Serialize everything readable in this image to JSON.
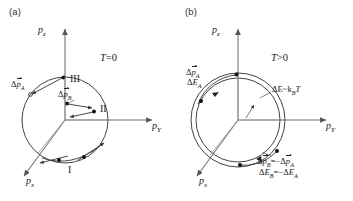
{
  "figure": {
    "panels": [
      {
        "tag": "(a)",
        "condition": "T=0",
        "condition_symbol": "T",
        "condition_op": "=",
        "condition_value": "0",
        "axes": {
          "z": "p",
          "z_sub": "z",
          "y": "p",
          "y_sub": "Y",
          "x": "p",
          "x_sub": "x"
        },
        "regions": [
          "I",
          "II",
          "III"
        ],
        "annotations": [
          {
            "delta": "Δ",
            "symbol": "p",
            "sub": "A",
            "vector": true
          },
          {
            "delta": "Δ",
            "symbol": "p",
            "sub": "B",
            "vector": true
          }
        ],
        "shell": "single"
      },
      {
        "tag": "(b)",
        "condition": "T>0",
        "condition_symbol": "T",
        "condition_op": ">",
        "condition_value": "0",
        "axes": {
          "z": "p",
          "z_sub": "z",
          "y": "p",
          "y_sub": "Y",
          "x": "p",
          "x_sub": "x"
        },
        "annotations": [
          {
            "line1_momentum": "Δp⃗",
            "line1_sub": "A"
          },
          {
            "line2_energy": "ΔE",
            "line2_sub": "A"
          }
        ],
        "thermal_width": "ΔE~k",
        "thermal_width_sub": "B",
        "thermal_width_tail": "T",
        "relation_momentum_lhs": "Δp",
        "relation_momentum_lhs_sub": "B",
        "relation_momentum_rhs": "Δp",
        "relation_momentum_rhs_sub": "A",
        "relation_energy_lhs": "ΔE",
        "relation_energy_lhs_sub": "B",
        "relation_energy_rhs": "ΔE",
        "relation_energy_rhs_sub": "A",
        "shell": "double"
      }
    ],
    "colors": {
      "ink": "#222222",
      "axis": "#555555",
      "circle": "#444444",
      "background": "#ffffff"
    }
  },
  "labels": {
    "panel_a_tag": "(a)",
    "panel_b_tag": "(b)",
    "T_zero_sym": "T",
    "T_zero_op": "=",
    "T_zero_val": "0",
    "T_pos_sym": "T",
    "T_pos_op": ">",
    "T_pos_val": "0",
    "pz": "p",
    "pz_sub": "z",
    "py": "p",
    "py_sub": "Y",
    "px": "p",
    "px_sub": "x",
    "region_I": "I",
    "region_II": "II",
    "region_III": "III",
    "dpA_delta": "Δ",
    "dpA_p": "p",
    "dpA_sub": "A",
    "dpB_delta": "Δ",
    "dpB_p": "p",
    "dpB_sub": "B",
    "b_dpA_delta": "Δ",
    "b_dpA_p": "p",
    "b_dpA_sub": "A",
    "b_dEA_delta": "Δ",
    "b_dEA_E": "E",
    "b_dEA_sub": "A",
    "thermal_head": "ΔE~k",
    "thermal_sub": "B",
    "thermal_tail": "T",
    "rel_p_delta1": "Δ",
    "rel_p_p1": "p",
    "rel_p_sub1": "B",
    "rel_p_eq": "=−",
    "rel_p_delta2": "Δ",
    "rel_p_p2": "p",
    "rel_p_sub2": "A",
    "rel_E_delta1": "Δ",
    "rel_E_E1": "E",
    "rel_E_sub1": "B",
    "rel_E_eq": "=−",
    "rel_E_delta2": "Δ",
    "rel_E_E2": "E",
    "rel_E_sub2": "A"
  }
}
